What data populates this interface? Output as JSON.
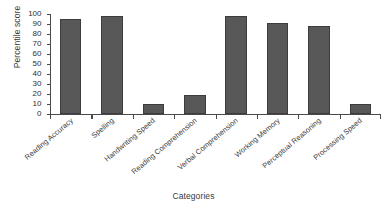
{
  "chart_data": {
    "type": "bar",
    "title": "",
    "xlabel": "Categories",
    "ylabel": "Percentile score",
    "categories": [
      "Reading Accuracy",
      "Spelling",
      "Handwriting Speed",
      "Reading Comprehension",
      "Verbal Comprehension",
      "Working Memory",
      "Perceptual Reasoning",
      "Processing Speed"
    ],
    "values": [
      95,
      98,
      10,
      19,
      98,
      91,
      88,
      10
    ],
    "ylim": [
      0,
      100
    ],
    "yticks": [
      0,
      10,
      20,
      30,
      40,
      50,
      60,
      70,
      80,
      90,
      100
    ],
    "ytick_labels": [
      "0",
      "10",
      "20",
      "30",
      "40",
      "50",
      "60",
      "70",
      "80",
      "90",
      "100"
    ],
    "grid": false,
    "legend": false,
    "bar_color": "#585858",
    "bar_edge_color": "#3c3c3c",
    "axis_color": "#4a4a4a",
    "text_color": "#3a3a3a",
    "background": "#ffffff"
  }
}
